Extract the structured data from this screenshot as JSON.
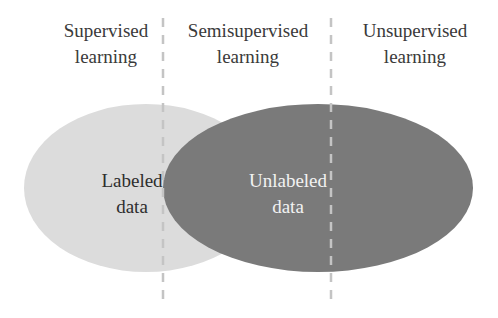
{
  "diagram": {
    "regions": [
      {
        "id": "supervised",
        "label_line1": "Supervised",
        "label_line2": "learning"
      },
      {
        "id": "semisupervised",
        "label_line1": "Semisupervised",
        "label_line2": "learning"
      },
      {
        "id": "unsupervised",
        "label_line1": "Unsupervised",
        "label_line2": "learning"
      }
    ],
    "ellipses": [
      {
        "id": "labeled",
        "label_line1": "Labeled",
        "label_line2": "data",
        "fill": "#dcdcdc",
        "text_color": "#2e2e2e"
      },
      {
        "id": "unlabeled",
        "label_line1": "Unlabeled",
        "label_line2": "data",
        "fill": "#7a7a7a",
        "text_color": "#f2f2f2"
      }
    ],
    "divider_color": "#c4c4c4"
  }
}
